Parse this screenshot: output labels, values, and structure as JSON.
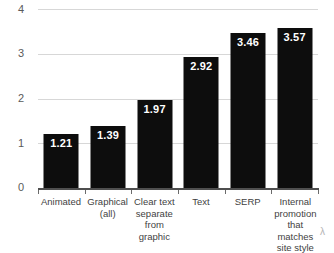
{
  "chart_data": {
    "type": "bar",
    "title": "",
    "subtitle": "",
    "xlabel": "",
    "ylabel": "",
    "categories": [
      "Animated",
      "Graphical (all)",
      "Clear text separate from graphic",
      "Text",
      "SERP",
      "Internal promotion that matches site style"
    ],
    "category_lines": [
      [
        "Animated"
      ],
      [
        "Graphical",
        "(all)"
      ],
      [
        "Clear text",
        "separate",
        "from graphic"
      ],
      [
        "Text"
      ],
      [
        "SERP"
      ],
      [
        "Internal",
        "promotion",
        "that matches",
        "site style"
      ]
    ],
    "values": [
      1.21,
      1.39,
      1.97,
      2.92,
      3.46,
      3.57
    ],
    "value_labels": [
      "1.21",
      "1.39",
      "1.97",
      "2.92",
      "3.46",
      "3.57"
    ],
    "ylim": [
      0,
      4
    ],
    "yticks": [
      0,
      1,
      2,
      3,
      4
    ],
    "ytick_labels": [
      "0",
      "1",
      "2",
      "3",
      "4"
    ],
    "grid": true,
    "grid_axis": "y",
    "legend": null,
    "legend_position": "none",
    "bar_color": "#0d0d0d",
    "label_color": "#ffffff",
    "grid_color": "#d7d7d7",
    "axis_color": "#4f4f4f",
    "background": "#ffffff"
  },
  "annotations": {
    "corner_glyph": "λ"
  }
}
